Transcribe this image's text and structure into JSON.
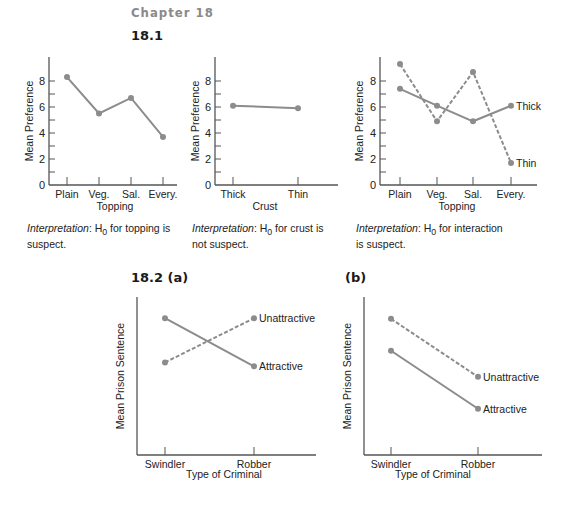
{
  "header": {
    "chapter": "Chapter 18",
    "section_1": "18.1",
    "section_2a": "18.2  (a)",
    "section_2b": "(b)"
  },
  "colors": {
    "line": "#8c8c8c",
    "axis": "#555555"
  },
  "interpretations": [
    {
      "label": "Interpretation",
      "text_a": ": H",
      "sub": "0",
      "text_b": " for topping is",
      "text_c": "suspect."
    },
    {
      "label": "Interpretation",
      "text_a": ": H",
      "sub": "0",
      "text_b": " for crust is",
      "text_c": "not suspect."
    },
    {
      "label": "Interpretation",
      "text_a": ": H",
      "sub": "0",
      "text_b": " for interaction",
      "text_c": "is suspect."
    }
  ],
  "chart_data": [
    {
      "type": "line",
      "title": "18.1 Topping",
      "xlabel": "Topping",
      "ylabel": "Mean Preference",
      "categories": [
        "Plain",
        "Veg.",
        "Sal.",
        "Every."
      ],
      "values": [
        8.3,
        5.5,
        6.7,
        3.7
      ],
      "ylim": [
        0,
        9
      ],
      "yticks": [
        0,
        2,
        4,
        6,
        8
      ]
    },
    {
      "type": "line",
      "title": "18.1 Crust",
      "xlabel": "Crust",
      "ylabel": "Mean Preference",
      "categories": [
        "Thick",
        "Thin"
      ],
      "values": [
        6.1,
        5.9
      ],
      "ylim": [
        0,
        9
      ],
      "yticks": [
        0,
        2,
        4,
        6,
        8
      ]
    },
    {
      "type": "line",
      "title": "18.1 Interaction",
      "xlabel": "Topping",
      "ylabel": "Mean Preference",
      "categories": [
        "Plain",
        "Veg.",
        "Sal.",
        "Every."
      ],
      "series": [
        {
          "name": "Thick",
          "style": "solid",
          "values": [
            7.4,
            6.1,
            4.9,
            6.1
          ]
        },
        {
          "name": "Thin",
          "style": "dashed",
          "values": [
            9.3,
            4.9,
            8.7,
            1.7
          ]
        }
      ],
      "ylim": [
        0,
        9
      ],
      "yticks": [
        0,
        2,
        4,
        6,
        8
      ]
    },
    {
      "type": "line",
      "title": "18.2 (a)",
      "xlabel": "Type of Criminal",
      "ylabel": "Mean Prison Sentence",
      "categories": [
        "Swindler",
        "Robber"
      ],
      "series": [
        {
          "name": "Attractive",
          "style": "solid",
          "values": [
            0.86,
            0.49
          ]
        },
        {
          "name": "Unattractive",
          "style": "dashed",
          "values": [
            0.52,
            0.86
          ]
        }
      ],
      "note": "relative values, no y-axis scale shown"
    },
    {
      "type": "line",
      "title": "18.2 (b)",
      "xlabel": "Type of Criminal",
      "ylabel": "Mean Prison Sentence",
      "categories": [
        "Swindler",
        "Robber"
      ],
      "series": [
        {
          "name": "Unattractive",
          "style": "dashed",
          "values": [
            0.87,
            0.47
          ]
        },
        {
          "name": "Attractive",
          "style": "solid",
          "values": [
            0.65,
            0.25
          ]
        }
      ],
      "note": "relative values, no y-axis scale shown"
    }
  ]
}
